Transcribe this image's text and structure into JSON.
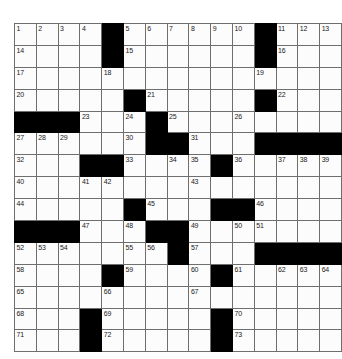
{
  "puzzle": {
    "title": "Crossword Grid",
    "rows": 15,
    "cols": 15,
    "colors": {
      "block": "#000000",
      "cell": "#fcfcfc",
      "grid_line": "#6e6e6e",
      "number_text": "#1a1a1a",
      "page_background": "#ffffff"
    },
    "grid": [
      [
        {
          "type": "white",
          "number": "1"
        },
        {
          "type": "white",
          "number": "2"
        },
        {
          "type": "white",
          "number": "3"
        },
        {
          "type": "white",
          "number": "4"
        },
        {
          "type": "block",
          "number": ""
        },
        {
          "type": "white",
          "number": "5"
        },
        {
          "type": "white",
          "number": "6"
        },
        {
          "type": "white",
          "number": "7"
        },
        {
          "type": "white",
          "number": "8"
        },
        {
          "type": "white",
          "number": "9"
        },
        {
          "type": "white",
          "number": "10"
        },
        {
          "type": "block",
          "number": ""
        },
        {
          "type": "white",
          "number": "11"
        },
        {
          "type": "white",
          "number": "12"
        },
        {
          "type": "white",
          "number": "13"
        }
      ],
      [
        {
          "type": "white",
          "number": "14"
        },
        {
          "type": "white",
          "number": ""
        },
        {
          "type": "white",
          "number": ""
        },
        {
          "type": "white",
          "number": ""
        },
        {
          "type": "block",
          "number": ""
        },
        {
          "type": "white",
          "number": "15"
        },
        {
          "type": "white",
          "number": ""
        },
        {
          "type": "white",
          "number": ""
        },
        {
          "type": "white",
          "number": ""
        },
        {
          "type": "white",
          "number": ""
        },
        {
          "type": "white",
          "number": ""
        },
        {
          "type": "block",
          "number": ""
        },
        {
          "type": "white",
          "number": "16"
        },
        {
          "type": "white",
          "number": ""
        },
        {
          "type": "white",
          "number": ""
        }
      ],
      [
        {
          "type": "white",
          "number": "17"
        },
        {
          "type": "white",
          "number": ""
        },
        {
          "type": "white",
          "number": ""
        },
        {
          "type": "white",
          "number": ""
        },
        {
          "type": "white",
          "number": "18"
        },
        {
          "type": "white",
          "number": ""
        },
        {
          "type": "white",
          "number": ""
        },
        {
          "type": "white",
          "number": ""
        },
        {
          "type": "white",
          "number": ""
        },
        {
          "type": "white",
          "number": ""
        },
        {
          "type": "white",
          "number": ""
        },
        {
          "type": "white",
          "number": "19"
        },
        {
          "type": "white",
          "number": ""
        },
        {
          "type": "white",
          "number": ""
        },
        {
          "type": "white",
          "number": ""
        }
      ],
      [
        {
          "type": "white",
          "number": "20"
        },
        {
          "type": "white",
          "number": ""
        },
        {
          "type": "white",
          "number": ""
        },
        {
          "type": "white",
          "number": ""
        },
        {
          "type": "white",
          "number": ""
        },
        {
          "type": "block",
          "number": ""
        },
        {
          "type": "white",
          "number": "21"
        },
        {
          "type": "white",
          "number": ""
        },
        {
          "type": "white",
          "number": ""
        },
        {
          "type": "white",
          "number": ""
        },
        {
          "type": "white",
          "number": ""
        },
        {
          "type": "block",
          "number": ""
        },
        {
          "type": "white",
          "number": "22"
        },
        {
          "type": "white",
          "number": ""
        },
        {
          "type": "white",
          "number": ""
        }
      ],
      [
        {
          "type": "block",
          "number": ""
        },
        {
          "type": "block",
          "number": ""
        },
        {
          "type": "block",
          "number": ""
        },
        {
          "type": "white",
          "number": "23"
        },
        {
          "type": "white",
          "number": ""
        },
        {
          "type": "white",
          "number": "24"
        },
        {
          "type": "block",
          "number": ""
        },
        {
          "type": "white",
          "number": "25"
        },
        {
          "type": "white",
          "number": ""
        },
        {
          "type": "white",
          "number": ""
        },
        {
          "type": "white",
          "number": "26"
        },
        {
          "type": "white",
          "number": ""
        },
        {
          "type": "white",
          "number": ""
        },
        {
          "type": "white",
          "number": ""
        },
        {
          "type": "white",
          "number": ""
        }
      ],
      [
        {
          "type": "white",
          "number": "27"
        },
        {
          "type": "white",
          "number": "28"
        },
        {
          "type": "white",
          "number": "29"
        },
        {
          "type": "white",
          "number": ""
        },
        {
          "type": "white",
          "number": ""
        },
        {
          "type": "white",
          "number": "30"
        },
        {
          "type": "block",
          "number": ""
        },
        {
          "type": "block",
          "number": ""
        },
        {
          "type": "white",
          "number": "31"
        },
        {
          "type": "white",
          "number": ""
        },
        {
          "type": "white",
          "number": ""
        },
        {
          "type": "block",
          "number": ""
        },
        {
          "type": "block",
          "number": ""
        },
        {
          "type": "block",
          "number": ""
        },
        {
          "type": "block",
          "number": ""
        }
      ],
      [
        {
          "type": "white",
          "number": "32"
        },
        {
          "type": "white",
          "number": ""
        },
        {
          "type": "white",
          "number": ""
        },
        {
          "type": "block",
          "number": ""
        },
        {
          "type": "block",
          "number": ""
        },
        {
          "type": "white",
          "number": "33"
        },
        {
          "type": "white",
          "number": ""
        },
        {
          "type": "white",
          "number": "34"
        },
        {
          "type": "white",
          "number": "35"
        },
        {
          "type": "block",
          "number": ""
        },
        {
          "type": "white",
          "number": "36"
        },
        {
          "type": "white",
          "number": ""
        },
        {
          "type": "white",
          "number": "37"
        },
        {
          "type": "white",
          "number": "38"
        },
        {
          "type": "white",
          "number": "39"
        }
      ],
      [
        {
          "type": "white",
          "number": "40"
        },
        {
          "type": "white",
          "number": ""
        },
        {
          "type": "white",
          "number": ""
        },
        {
          "type": "white",
          "number": "41"
        },
        {
          "type": "white",
          "number": "42"
        },
        {
          "type": "white",
          "number": ""
        },
        {
          "type": "white",
          "number": ""
        },
        {
          "type": "white",
          "number": ""
        },
        {
          "type": "white",
          "number": "43"
        },
        {
          "type": "white",
          "number": ""
        },
        {
          "type": "white",
          "number": ""
        },
        {
          "type": "white",
          "number": ""
        },
        {
          "type": "white",
          "number": ""
        },
        {
          "type": "white",
          "number": ""
        },
        {
          "type": "white",
          "number": ""
        }
      ],
      [
        {
          "type": "white",
          "number": "44"
        },
        {
          "type": "white",
          "number": ""
        },
        {
          "type": "white",
          "number": ""
        },
        {
          "type": "white",
          "number": ""
        },
        {
          "type": "white",
          "number": ""
        },
        {
          "type": "block",
          "number": ""
        },
        {
          "type": "white",
          "number": "45"
        },
        {
          "type": "white",
          "number": ""
        },
        {
          "type": "white",
          "number": ""
        },
        {
          "type": "block",
          "number": ""
        },
        {
          "type": "block",
          "number": ""
        },
        {
          "type": "white",
          "number": "46"
        },
        {
          "type": "white",
          "number": ""
        },
        {
          "type": "white",
          "number": ""
        },
        {
          "type": "white",
          "number": ""
        }
      ],
      [
        {
          "type": "block",
          "number": ""
        },
        {
          "type": "block",
          "number": ""
        },
        {
          "type": "block",
          "number": ""
        },
        {
          "type": "white",
          "number": "47"
        },
        {
          "type": "white",
          "number": ""
        },
        {
          "type": "white",
          "number": "48"
        },
        {
          "type": "block",
          "number": ""
        },
        {
          "type": "block",
          "number": ""
        },
        {
          "type": "white",
          "number": "49"
        },
        {
          "type": "white",
          "number": ""
        },
        {
          "type": "white",
          "number": "50"
        },
        {
          "type": "white",
          "number": "51"
        },
        {
          "type": "white",
          "number": ""
        },
        {
          "type": "white",
          "number": ""
        },
        {
          "type": "white",
          "number": ""
        }
      ],
      [
        {
          "type": "white",
          "number": "52"
        },
        {
          "type": "white",
          "number": "53"
        },
        {
          "type": "white",
          "number": "54"
        },
        {
          "type": "white",
          "number": ""
        },
        {
          "type": "white",
          "number": ""
        },
        {
          "type": "white",
          "number": "55"
        },
        {
          "type": "white",
          "number": "56"
        },
        {
          "type": "block",
          "number": ""
        },
        {
          "type": "white",
          "number": "57"
        },
        {
          "type": "white",
          "number": ""
        },
        {
          "type": "white",
          "number": ""
        },
        {
          "type": "block",
          "number": ""
        },
        {
          "type": "block",
          "number": ""
        },
        {
          "type": "block",
          "number": ""
        },
        {
          "type": "block",
          "number": ""
        }
      ],
      [
        {
          "type": "white",
          "number": "58"
        },
        {
          "type": "white",
          "number": ""
        },
        {
          "type": "white",
          "number": ""
        },
        {
          "type": "white",
          "number": ""
        },
        {
          "type": "block",
          "number": ""
        },
        {
          "type": "white",
          "number": "59"
        },
        {
          "type": "white",
          "number": ""
        },
        {
          "type": "white",
          "number": ""
        },
        {
          "type": "white",
          "number": "60"
        },
        {
          "type": "block",
          "number": ""
        },
        {
          "type": "white",
          "number": "61"
        },
        {
          "type": "white",
          "number": ""
        },
        {
          "type": "white",
          "number": "62"
        },
        {
          "type": "white",
          "number": "63"
        },
        {
          "type": "white",
          "number": "64"
        }
      ],
      [
        {
          "type": "white",
          "number": "65"
        },
        {
          "type": "white",
          "number": ""
        },
        {
          "type": "white",
          "number": ""
        },
        {
          "type": "white",
          "number": ""
        },
        {
          "type": "white",
          "number": "66"
        },
        {
          "type": "white",
          "number": ""
        },
        {
          "type": "white",
          "number": ""
        },
        {
          "type": "white",
          "number": ""
        },
        {
          "type": "white",
          "number": "67"
        },
        {
          "type": "white",
          "number": ""
        },
        {
          "type": "white",
          "number": ""
        },
        {
          "type": "white",
          "number": ""
        },
        {
          "type": "white",
          "number": ""
        },
        {
          "type": "white",
          "number": ""
        },
        {
          "type": "white",
          "number": ""
        }
      ],
      [
        {
          "type": "white",
          "number": "68"
        },
        {
          "type": "white",
          "number": ""
        },
        {
          "type": "white",
          "number": ""
        },
        {
          "type": "block",
          "number": ""
        },
        {
          "type": "white",
          "number": "69"
        },
        {
          "type": "white",
          "number": ""
        },
        {
          "type": "white",
          "number": ""
        },
        {
          "type": "white",
          "number": ""
        },
        {
          "type": "white",
          "number": ""
        },
        {
          "type": "block",
          "number": ""
        },
        {
          "type": "white",
          "number": "70"
        },
        {
          "type": "white",
          "number": ""
        },
        {
          "type": "white",
          "number": ""
        },
        {
          "type": "white",
          "number": ""
        },
        {
          "type": "white",
          "number": ""
        }
      ],
      [
        {
          "type": "white",
          "number": "71"
        },
        {
          "type": "white",
          "number": ""
        },
        {
          "type": "white",
          "number": ""
        },
        {
          "type": "block",
          "number": ""
        },
        {
          "type": "white",
          "number": "72"
        },
        {
          "type": "white",
          "number": ""
        },
        {
          "type": "white",
          "number": ""
        },
        {
          "type": "white",
          "number": ""
        },
        {
          "type": "white",
          "number": ""
        },
        {
          "type": "block",
          "number": ""
        },
        {
          "type": "white",
          "number": "73"
        },
        {
          "type": "white",
          "number": ""
        },
        {
          "type": "white",
          "number": ""
        },
        {
          "type": "white",
          "number": ""
        },
        {
          "type": "white",
          "number": ""
        }
      ]
    ]
  }
}
